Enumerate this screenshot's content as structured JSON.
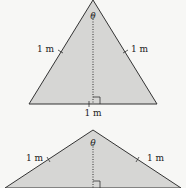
{
  "diagrams": [
    {
      "name": "tall-triangle",
      "side_left_label": "1 m",
      "side_right_label": "1 m",
      "base_label": "1 m",
      "apex_angle_label": "θ"
    },
    {
      "name": "wide-triangle",
      "side_left_label": "1 m",
      "side_right_label": "1 m",
      "apex_angle_label": "θ"
    }
  ],
  "colors": {
    "fill": "#d6d6d4",
    "stroke": "#333333",
    "background": "#f7f7f5"
  }
}
